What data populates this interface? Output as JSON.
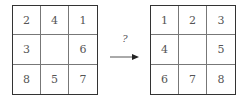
{
  "diagram": {
    "start_state": {
      "cells": [
        "2",
        "4",
        "1",
        "3",
        "",
        "6",
        "8",
        "5",
        "7"
      ]
    },
    "goal_state": {
      "cells": [
        "1",
        "2",
        "3",
        "4",
        "",
        "5",
        "6",
        "7",
        "8"
      ]
    },
    "transition": {
      "label": "?",
      "icon": "right-arrow-icon"
    },
    "colors": {
      "border": "#333333",
      "inner_lines": "#777777",
      "text": "#555555"
    }
  }
}
